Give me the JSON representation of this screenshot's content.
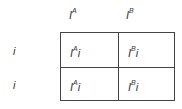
{
  "diagram": {
    "type": "punnett-square",
    "columns": [
      {
        "base": "I",
        "sup": "A"
      },
      {
        "base": "I",
        "sup": "B"
      }
    ],
    "rows": [
      {
        "base": "i",
        "sup": ""
      },
      {
        "base": "i",
        "sup": ""
      }
    ],
    "cells": [
      [
        {
          "base": "I",
          "sup": "A",
          "rest": "i"
        },
        {
          "base": "I",
          "sup": "B",
          "rest": "i"
        }
      ],
      [
        {
          "base": "I",
          "sup": "A",
          "rest": "i"
        },
        {
          "base": "I",
          "sup": "B",
          "rest": "i"
        }
      ]
    ]
  }
}
